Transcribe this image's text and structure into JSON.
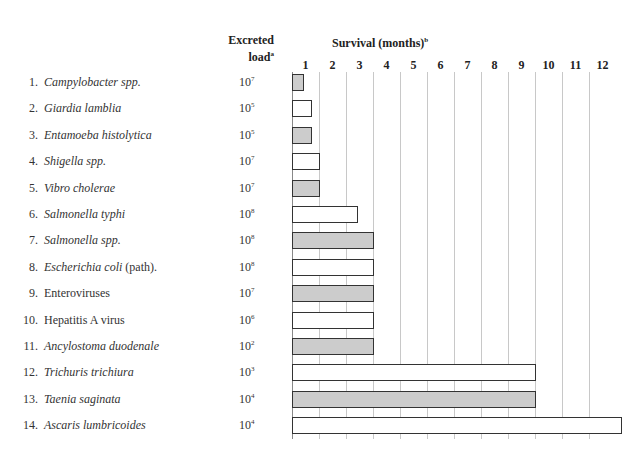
{
  "header": {
    "load_line1": "Excreted",
    "load_line2": "load",
    "load_sup": "a",
    "survival": "Survival (months)",
    "survival_sup": "b"
  },
  "chart_data": {
    "type": "bar",
    "orientation": "horizontal",
    "title": "Survival (months)",
    "xlabel": "Survival (months)",
    "x_ticks": [
      "1",
      "2",
      "3",
      "4",
      "5",
      "6",
      "7",
      "8",
      "9",
      "10",
      "11",
      "12"
    ],
    "xlim": [
      0,
      12
    ],
    "grid": true,
    "categories": [
      "Campylobacter spp.",
      "Giardia lamblia",
      "Entamoeba histolytica",
      "Shigella spp.",
      "Vibro cholerae",
      "Salmonella typhi",
      "Salmonella spp.",
      "Escherichia coli (path).",
      "Enteroviruses",
      "Hepatitis A virus",
      "Ancylostoma duodenale",
      "Trichuris trichiura",
      "Taenia saginata",
      "Ascaris lumbricoides"
    ],
    "values": [
      0.4,
      0.7,
      0.7,
      1,
      1,
      2.4,
      3,
      3,
      3,
      3,
      3,
      9,
      9,
      12
    ],
    "excreted_load": [
      "10^7",
      "10^5",
      "10^5",
      "10^7",
      "10^7",
      "10^8",
      "10^8",
      "10^8",
      "10^7",
      "10^6",
      "10^2",
      "10^3",
      "10^4",
      "10^4"
    ],
    "fill": [
      "grey",
      "white",
      "grey",
      "white",
      "grey",
      "white",
      "grey",
      "white",
      "grey",
      "white",
      "grey",
      "white",
      "grey",
      "white"
    ]
  },
  "rows": [
    {
      "n": "1.",
      "name": "Campylobacter spp.",
      "italic": true,
      "suffix": "",
      "base": "10",
      "exp": "7",
      "months": 0.4,
      "fill": "grey"
    },
    {
      "n": "2.",
      "name": "Giardia lamblia",
      "italic": true,
      "suffix": "",
      "base": "10",
      "exp": "5",
      "months": 0.7,
      "fill": "white"
    },
    {
      "n": "3.",
      "name": "Entamoeba histolytica",
      "italic": true,
      "suffix": "",
      "base": "10",
      "exp": "5",
      "months": 0.7,
      "fill": "grey"
    },
    {
      "n": "4.",
      "name": "Shigella spp.",
      "italic": true,
      "suffix": "",
      "base": "10",
      "exp": "7",
      "months": 1,
      "fill": "white"
    },
    {
      "n": "5.",
      "name": "Vibro cholerae",
      "italic": true,
      "suffix": "",
      "base": "10",
      "exp": "7",
      "months": 1,
      "fill": "grey"
    },
    {
      "n": "6.",
      "name": "Salmonella typhi",
      "italic": true,
      "suffix": "",
      "base": "10",
      "exp": "8",
      "months": 2.4,
      "fill": "white"
    },
    {
      "n": "7.",
      "name": "Salmonella spp.",
      "italic": true,
      "suffix": "",
      "base": "10",
      "exp": "8",
      "months": 3,
      "fill": "grey"
    },
    {
      "n": "8.",
      "name": "Escherichia coli",
      "italic": true,
      "suffix": " (path).",
      "base": "10",
      "exp": "8",
      "months": 3,
      "fill": "white"
    },
    {
      "n": "9.",
      "name": "Enteroviruses",
      "italic": false,
      "suffix": "",
      "base": "10",
      "exp": "7",
      "months": 3,
      "fill": "grey"
    },
    {
      "n": "10.",
      "name": "Hepatitis A virus",
      "italic": false,
      "suffix": "",
      "base": "10",
      "exp": "6",
      "months": 3,
      "fill": "white"
    },
    {
      "n": "11.",
      "name": "Ancylostoma duodenale",
      "italic": true,
      "suffix": "",
      "base": "10",
      "exp": "2",
      "months": 3,
      "fill": "grey"
    },
    {
      "n": "12.",
      "name": "Trichuris trichiura",
      "italic": true,
      "suffix": "",
      "base": "10",
      "exp": "3",
      "months": 9,
      "fill": "white"
    },
    {
      "n": "13.",
      "name": "Taenia saginata",
      "italic": true,
      "suffix": "",
      "base": "10",
      "exp": "4",
      "months": 9,
      "fill": "grey"
    },
    {
      "n": "14.",
      "name": "Ascaris lumbricoides",
      "italic": true,
      "suffix": "",
      "base": "10",
      "exp": "4",
      "months": 12.2,
      "fill": "white"
    }
  ]
}
